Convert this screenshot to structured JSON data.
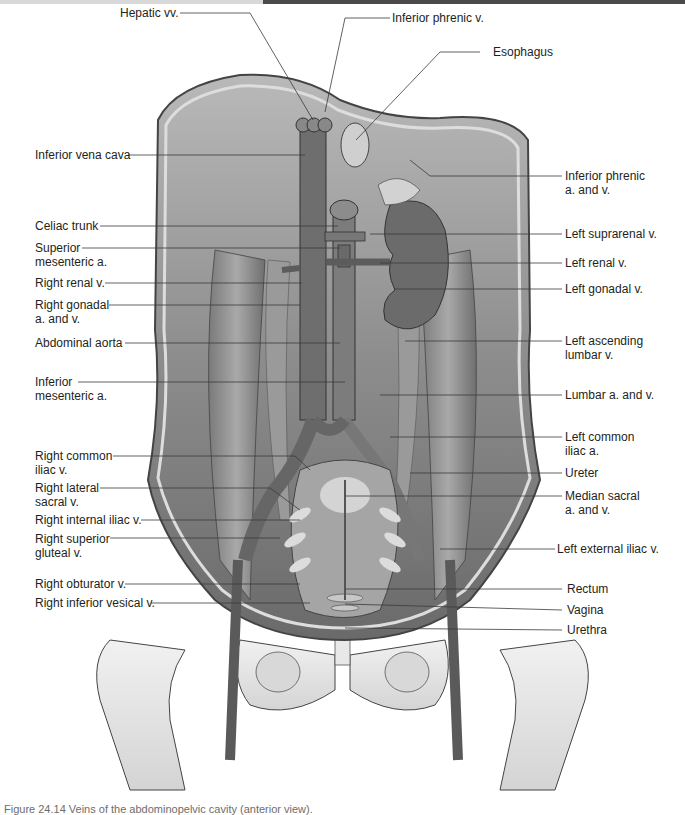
{
  "header_bar": {
    "left_color": "#d9d9d9",
    "right_color": "#4a4a4a"
  },
  "colors": {
    "background": "#ffffff",
    "label_text": "#231f20",
    "leader_line": "#3a3a3a",
    "tissue_dark": "#5e5e5e",
    "tissue_mid": "#8a8a8a",
    "tissue_light": "#c9c9c9",
    "bone": "#e6e6e6"
  },
  "figure": {
    "labels_top": [
      {
        "id": "hepatic-vv",
        "text": "Hepatic vv."
      },
      {
        "id": "inferior-phrenic-v",
        "text": "Inferior phrenic v."
      },
      {
        "id": "esophagus",
        "text": "Esophagus"
      }
    ],
    "labels_left": [
      {
        "id": "inferior-vena-cava",
        "line1": "Inferior vena cava",
        "line2": ""
      },
      {
        "id": "celiac-trunk",
        "line1": "Celiac trunk",
        "line2": ""
      },
      {
        "id": "superior-mesenteric-a",
        "line1": "Superior",
        "line2": "mesenteric a."
      },
      {
        "id": "right-renal-v",
        "line1": "Right renal v.",
        "line2": ""
      },
      {
        "id": "right-gonadal-a-and-v",
        "line1": "Right gonadal",
        "line2": "a. and v."
      },
      {
        "id": "abdominal-aorta",
        "line1": "Abdominal aorta",
        "line2": ""
      },
      {
        "id": "inferior-mesenteric-a",
        "line1": "Inferior",
        "line2": "mesenteric a."
      },
      {
        "id": "right-common-iliac-v",
        "line1": "Right common",
        "line2": "iliac v."
      },
      {
        "id": "right-lateral-sacral-v",
        "line1": "Right lateral",
        "line2": "sacral v."
      },
      {
        "id": "right-internal-iliac-v",
        "line1": "Right internal iliac v.",
        "line2": ""
      },
      {
        "id": "right-superior-gluteal-v",
        "line1": "Right superior",
        "line2": "gluteal v."
      },
      {
        "id": "right-obturator-v",
        "line1": "Right obturator v.",
        "line2": ""
      },
      {
        "id": "right-inferior-vesical-v",
        "line1": "Right inferior vesical v.",
        "line2": ""
      }
    ],
    "labels_right": [
      {
        "id": "inferior-phrenic-a-and-v",
        "line1": "Inferior phrenic",
        "line2": "a. and v."
      },
      {
        "id": "left-suprarenal-v",
        "line1": "Left suprarenal v.",
        "line2": ""
      },
      {
        "id": "left-renal-v",
        "line1": "Left renal v.",
        "line2": ""
      },
      {
        "id": "left-gonadal-v",
        "line1": "Left gonadal v.",
        "line2": ""
      },
      {
        "id": "left-ascending-lumbar-v",
        "line1": "Left ascending",
        "line2": "lumbar v."
      },
      {
        "id": "lumbar-a-and-v",
        "line1": "Lumbar a. and v.",
        "line2": ""
      },
      {
        "id": "left-common-iliac-a",
        "line1": "Left common",
        "line2": "iliac a."
      },
      {
        "id": "ureter",
        "line1": "Ureter",
        "line2": ""
      },
      {
        "id": "median-sacral-a-and-v",
        "line1": "Median sacral",
        "line2": "a. and v."
      },
      {
        "id": "left-external-iliac-v",
        "line1": "Left external iliac v.",
        "line2": ""
      },
      {
        "id": "rectum",
        "line1": "Rectum",
        "line2": ""
      },
      {
        "id": "vagina",
        "line1": "Vagina",
        "line2": ""
      },
      {
        "id": "urethra",
        "line1": "Urethra",
        "line2": ""
      }
    ]
  },
  "caption": {
    "text": "Figure 24.14  Veins of the abdominopelvic cavity (anterior view)."
  }
}
